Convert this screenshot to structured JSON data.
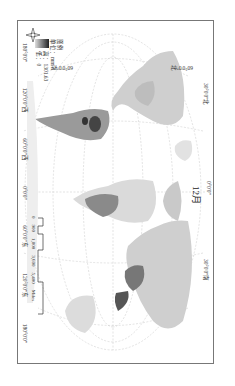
{
  "map": {
    "month_label": "12月",
    "graticule_top": {
      "left": "30°0'0\"北",
      "center": "0°0'0\"",
      "right": "30°0'0\"南"
    },
    "graticule_left": {
      "north60": "60°0'0\"北",
      "south60": "60°0'0\"南"
    },
    "longitude_labels": [
      "180°0'0\"",
      "120°0'0\"西",
      "60°0'0\"西",
      "0°0'0\"",
      "60°0'0\"东",
      "120°0'0\"东",
      "180°0'0\""
    ],
    "legend": {
      "title": "图例",
      "unit": "单位：mm",
      "high": "高：1301.63",
      "low": "低：0"
    },
    "scale_bar": {
      "ticks": [
        "0",
        "900",
        "1,800",
        "3,600",
        "5,400"
      ],
      "unit": "Miles"
    },
    "compass": {
      "n": "N",
      "s": "S",
      "e": "E",
      "w": "W"
    },
    "colors": {
      "frame": "#777777",
      "land_light": "#d8d8d8",
      "land_dark": "#333333",
      "graticule": "#cccccc"
    }
  }
}
